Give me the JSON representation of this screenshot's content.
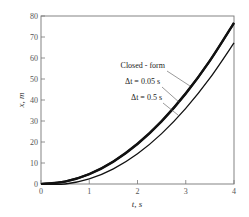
{
  "chart_data": {
    "type": "line",
    "title": "",
    "xlabel": "t, s",
    "ylabel": "x, m",
    "xlim": [
      0,
      4
    ],
    "ylim": [
      0,
      80
    ],
    "xticks": [
      0,
      1,
      2,
      3,
      4
    ],
    "yticks": [
      0,
      10,
      20,
      30,
      40,
      50,
      60,
      70,
      80
    ],
    "xtick_labels": [
      "0",
      "1",
      "2",
      "3",
      "4"
    ],
    "ytick_labels": [
      "0",
      "10",
      "20",
      "30",
      "40",
      "50",
      "60",
      "70",
      "80"
    ],
    "grid": false,
    "series": [
      {
        "name": "Closed - form",
        "x": [
          0,
          0.5,
          1,
          1.5,
          2,
          2.5,
          3,
          3.5,
          4
        ],
        "y": [
          0,
          1.2,
          4.8,
          10.8,
          19.2,
          30,
          43.2,
          58.8,
          76.8
        ],
        "line_weight": "thick"
      },
      {
        "name": "Δt = 0.05 s",
        "x": [
          0,
          0.5,
          1,
          1.5,
          2,
          2.5,
          3,
          3.5,
          4
        ],
        "y": [
          0,
          1.1,
          4.6,
          10.6,
          19.0,
          29.8,
          43.0,
          58.6,
          76.6
        ],
        "line_weight": "thick"
      },
      {
        "name": "Δt = 0.5 s",
        "x": [
          0,
          0.5,
          1,
          1.5,
          2,
          2.5,
          3,
          3.5,
          4
        ],
        "y": [
          0,
          0,
          2.4,
          7.2,
          14.4,
          24,
          36,
          50.4,
          67.2
        ],
        "line_weight": "thin"
      }
    ],
    "annotations": [
      {
        "text": "Closed - form",
        "series": "Closed - form"
      },
      {
        "text": "Δt = 0.05 s",
        "series": "Δt = 0.05 s"
      },
      {
        "text": "Δt = 0.5 s",
        "series": "Δt = 0.5 s"
      }
    ],
    "legend": "inline annotations, center-right"
  }
}
